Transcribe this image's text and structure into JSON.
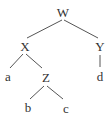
{
  "diagram": {
    "type": "tree",
    "line_color": "#555555",
    "text_color": "#333333",
    "nodes": [
      {
        "id": "W",
        "label": "W",
        "x": 63,
        "y": 12
      },
      {
        "id": "X",
        "label": "X",
        "x": 25,
        "y": 46
      },
      {
        "id": "Y",
        "label": "Y",
        "x": 100,
        "y": 46
      },
      {
        "id": "a",
        "label": "a",
        "x": 8,
        "y": 76
      },
      {
        "id": "Z",
        "label": "Z",
        "x": 46,
        "y": 77
      },
      {
        "id": "d",
        "label": "d",
        "x": 100,
        "y": 76
      },
      {
        "id": "b",
        "label": "b",
        "x": 28,
        "y": 107
      },
      {
        "id": "c",
        "label": "c",
        "x": 66,
        "y": 108
      }
    ],
    "edges": [
      {
        "from": "W",
        "to": "X",
        "x1": 62,
        "y1": 20,
        "x2": 27,
        "y2": 38
      },
      {
        "from": "W",
        "to": "Y",
        "x1": 64,
        "y1": 20,
        "x2": 98,
        "y2": 38
      },
      {
        "from": "X",
        "to": "a",
        "x1": 23,
        "y1": 54,
        "x2": 10,
        "y2": 68
      },
      {
        "from": "X",
        "to": "Z",
        "x1": 26,
        "y1": 54,
        "x2": 42,
        "y2": 68
      },
      {
        "from": "Y",
        "to": "d",
        "x1": 100,
        "y1": 55,
        "x2": 100,
        "y2": 67
      },
      {
        "from": "Z",
        "to": "b",
        "x1": 44,
        "y1": 86,
        "x2": 30,
        "y2": 99
      },
      {
        "from": "Z",
        "to": "c",
        "x1": 47,
        "y1": 86,
        "x2": 63,
        "y2": 99
      }
    ]
  }
}
